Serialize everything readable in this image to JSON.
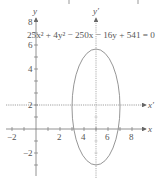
{
  "figure": {
    "equation": "25x² + 4y² − 250x − 16y + 541 = 0",
    "axes": {
      "x_label": "x",
      "y_label": "y",
      "x_prime_label": "x′",
      "y_prime_label": "y′"
    },
    "x_ticks": [
      {
        "value": -2,
        "label": "−2"
      },
      {
        "value": 2,
        "label": "2"
      },
      {
        "value": 4,
        "label": "4"
      },
      {
        "value": 6,
        "label": "6"
      },
      {
        "value": 8,
        "label": "8"
      }
    ],
    "y_ticks": [
      {
        "value": 8,
        "label": "8"
      },
      {
        "value": 6,
        "label": "6"
      },
      {
        "value": 4,
        "label": "4"
      },
      {
        "value": 2,
        "label": "2"
      },
      {
        "value": -2,
        "label": "−2"
      }
    ],
    "ellipse": {
      "center": [
        5,
        2
      ],
      "semi_axis_x": 2,
      "semi_axis_y": 5
    },
    "colors": {
      "axis": "#777777",
      "curve": "#8a8a8a",
      "text": "#555555"
    }
  }
}
